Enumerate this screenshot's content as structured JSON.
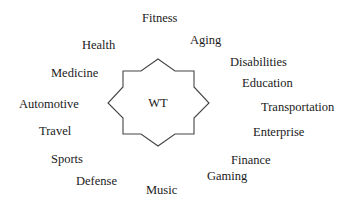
{
  "diagram": {
    "center": {
      "label": "WT",
      "shape": "eight-point-star",
      "stroke_color": "#444444"
    },
    "topics": [
      {
        "id": "fitness",
        "label": "Fitness"
      },
      {
        "id": "aging",
        "label": "Aging"
      },
      {
        "id": "health",
        "label": "Health"
      },
      {
        "id": "disabilities",
        "label": "Disabilities"
      },
      {
        "id": "medicine",
        "label": "Medicine"
      },
      {
        "id": "education",
        "label": "Education"
      },
      {
        "id": "automotive",
        "label": "Automotive"
      },
      {
        "id": "transportation",
        "label": "Transportation"
      },
      {
        "id": "travel",
        "label": "Travel"
      },
      {
        "id": "enterprise",
        "label": "Enterprise"
      },
      {
        "id": "sports",
        "label": "Sports"
      },
      {
        "id": "finance",
        "label": "Finance"
      },
      {
        "id": "gaming",
        "label": "Gaming"
      },
      {
        "id": "defense",
        "label": "Defense"
      },
      {
        "id": "music",
        "label": "Music"
      }
    ]
  }
}
